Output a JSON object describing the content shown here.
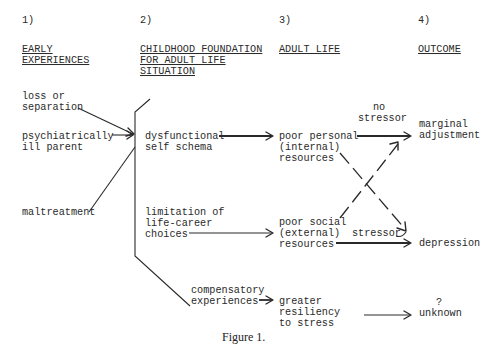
{
  "columns": [
    {
      "number": "1)",
      "heading_lines": [
        "EARLY",
        "EXPERIENCES"
      ]
    },
    {
      "number": "2)",
      "heading_lines": [
        "CHILDHOOD FOUNDATION",
        "FOR ADULT LIFE",
        "SITUATION"
      ]
    },
    {
      "number": "3)",
      "heading_lines": [
        "ADULT LIFE"
      ]
    },
    {
      "number": "4)",
      "heading_lines": [
        "OUTCOME"
      ]
    }
  ],
  "early_experiences": [
    {
      "lines": [
        "loss or",
        "separation"
      ]
    },
    {
      "lines": [
        "psychiatrically",
        "ill parent"
      ]
    },
    {
      "lines": [
        "maltreatment"
      ]
    }
  ],
  "childhood_foundation": [
    {
      "lines": [
        "dysfunctional",
        "self schema"
      ]
    },
    {
      "lines": [
        "limitation of",
        "life-career",
        "choices"
      ]
    },
    {
      "lines": [
        "compensatory",
        "experiences"
      ]
    }
  ],
  "adult_life": [
    {
      "lines": [
        "poor personal",
        "(internal)",
        "resources"
      ]
    },
    {
      "lines": [
        "poor social",
        "(external)",
        "resources"
      ]
    },
    {
      "lines": [
        "greater",
        "resiliency",
        "to stress"
      ]
    }
  ],
  "outcomes": [
    {
      "lines": [
        "marginal",
        "adjustment"
      ]
    },
    {
      "lines": [
        "depression"
      ]
    },
    {
      "lines": [
        "?",
        "unknown"
      ]
    }
  ],
  "edge_labels": {
    "no_stressor": [
      "no",
      "stressor"
    ],
    "stressor": "stressor"
  },
  "caption": "Figure 1.",
  "diagram": {
    "nodes": [
      "loss or separation",
      "psychiatrically ill parent",
      "maltreatment",
      "dysfunctional self schema",
      "limitation of life-career choices",
      "compensatory experiences",
      "poor personal (internal) resources",
      "poor social (external) resources",
      "greater resiliency to stress",
      "marginal adjustment",
      "depression",
      "? unknown"
    ],
    "edges": [
      {
        "from": "early experiences",
        "to": "childhood foundation bracket"
      },
      {
        "from": "dysfunctional self schema",
        "to": "poor personal (internal) resources"
      },
      {
        "from": "limitation of life-career choices",
        "to": "poor social (external) resources"
      },
      {
        "from": "compensatory experiences",
        "to": "greater resiliency to stress"
      },
      {
        "from": "poor personal (internal) resources",
        "to": "marginal adjustment"
      },
      {
        "from": "poor personal (internal) resources",
        "to": "depression",
        "style": "dashed",
        "label": "stressor"
      },
      {
        "from": "poor social (external) resources",
        "to": "marginal adjustment",
        "style": "dashed",
        "label": "no stressor"
      },
      {
        "from": "poor social (external) resources",
        "to": "depression"
      },
      {
        "from": "greater resiliency to stress",
        "to": "? unknown"
      }
    ]
  }
}
